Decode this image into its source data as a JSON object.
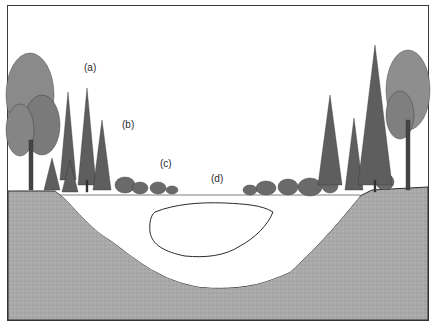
{
  "figure": {
    "labels": [
      {
        "id": "a",
        "text": "(a)",
        "x": 84,
        "y": 62
      },
      {
        "id": "b",
        "text": "(b)",
        "x": 122,
        "y": 119
      },
      {
        "id": "c",
        "text": "(c)",
        "x": 160,
        "y": 158
      },
      {
        "id": "d",
        "text": "(d)",
        "x": 211,
        "y": 173
      }
    ],
    "colors": {
      "ground": "#a8a8a8",
      "water": "#ffffff",
      "ink": "#2a2a2a",
      "border": "#3a3a3a",
      "foliage": "#6a6a6a"
    }
  }
}
